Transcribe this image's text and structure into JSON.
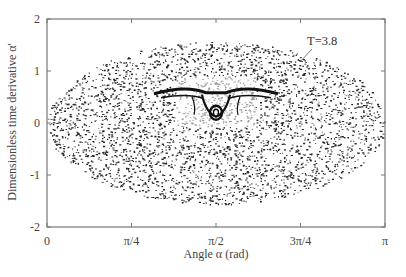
{
  "chart_data": {
    "type": "scatter",
    "title": "",
    "xlabel": "Angle α (rad)",
    "ylabel": "Dimensionless time derivative  α'",
    "xlim": [
      0,
      3.14159
    ],
    "ylim": [
      -2,
      2
    ],
    "x_ticks": [
      {
        "value": 0,
        "label": "0"
      },
      {
        "value": 0.7854,
        "label": "π/4"
      },
      {
        "value": 1.5708,
        "label": "π/2"
      },
      {
        "value": 2.3562,
        "label": "3π/4"
      },
      {
        "value": 3.14159,
        "label": "π"
      }
    ],
    "y_ticks": [
      {
        "value": 2,
        "label": "2"
      },
      {
        "value": 1,
        "label": "1"
      },
      {
        "value": 0,
        "label": "0"
      },
      {
        "value": -1,
        "label": "-1"
      },
      {
        "value": -2,
        "label": "-2"
      }
    ],
    "grid": false,
    "legend": null,
    "annotations": [
      {
        "text": "T=3.8",
        "x": 2.6,
        "y": 1.25,
        "arrow_to": [
          2.45,
          0.9
        ]
      }
    ],
    "series": [
      {
        "name": "Poincaré map (chaotic sea)",
        "description": "Dense scatter filling an elliptical region bounded by α' ≈ ±1.56 at α = π/2 and α ≈ 0 to π at α' = 0",
        "region": {
          "center": [
            1.5708,
            0
          ],
          "semi_axis_x": 1.5708,
          "semi_axis_y": 1.56
        },
        "point_color": "#111111"
      },
      {
        "name": "Regular island structure",
        "description": "Bird-shaped regular structure near α = π/2, α' ≈ 0.3 to 0.6, with wings spanning α ≈ 1.15 to 2.05",
        "center": [
          1.5708,
          0.45
        ]
      }
    ]
  },
  "labels": {
    "annotation": "T=3.8",
    "xlabel": "Angle α (rad)",
    "ylabel": "Dimensionless time derivative  α'"
  }
}
